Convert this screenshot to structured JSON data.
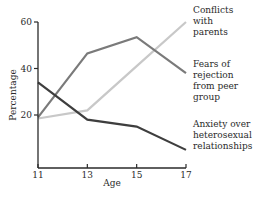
{
  "chart_data": {
    "type": "line",
    "title": "",
    "xlabel": "Age",
    "ylabel": "Percentage",
    "x": [
      11,
      13,
      15,
      17
    ],
    "xticks": [
      "11",
      "13",
      "15",
      "17"
    ],
    "yticks": [
      "20",
      "40",
      "60"
    ],
    "ytick_values": [
      20,
      40,
      60
    ],
    "xlim": [
      11,
      17
    ],
    "ylim": [
      -3,
      60
    ],
    "grid": false,
    "legend_position": "right, inline labels at line ends",
    "series": [
      {
        "name": "Conflicts with parents",
        "label_lines": [
          "Conflicts",
          "with",
          "parents"
        ],
        "color": "#c8c8c8",
        "values": [
          18.5,
          22,
          41,
          60
        ]
      },
      {
        "name": "Fears of rejection from peer group",
        "label_lines": [
          "Fears of",
          "rejection",
          "from peer",
          "group"
        ],
        "color": "#7a7a7a",
        "values": [
          19,
          46.5,
          53.5,
          38
        ]
      },
      {
        "name": "Anxiety over heterosexual relationships",
        "label_lines": [
          "Anxiety over",
          "heterosexual",
          "relationships"
        ],
        "color": "#3e3e3e",
        "values": [
          34,
          18,
          15,
          5
        ]
      }
    ]
  },
  "axis_color": "#2a2a2a"
}
